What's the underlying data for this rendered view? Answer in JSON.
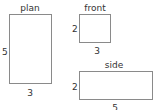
{
  "views": {
    "plan": {
      "title": "plan",
      "width_label": "3",
      "height_label": "5"
    },
    "front": {
      "title": "front",
      "width_label": "3",
      "height_label": "2"
    },
    "side": {
      "title": "side",
      "width_label": "5",
      "height_label": "2"
    }
  }
}
